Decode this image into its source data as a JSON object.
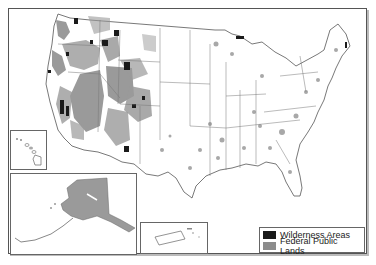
{
  "map": {
    "title": "Wilderness Areas and Federal Public Lands of the United States",
    "insets": [
      {
        "name": "Hawaii"
      },
      {
        "name": "Alaska"
      },
      {
        "name": "Puerto Rico"
      }
    ]
  },
  "legend": {
    "items": [
      {
        "label": "Wilderness Areas",
        "color": "#1a1a1a"
      },
      {
        "label": "Federal Public Lands",
        "color": "#8c8c8c"
      }
    ]
  },
  "colors": {
    "wilderness": "#1a1a1a",
    "federal": "#9a9a9a",
    "boundary": "#666666",
    "background": "#ffffff"
  }
}
